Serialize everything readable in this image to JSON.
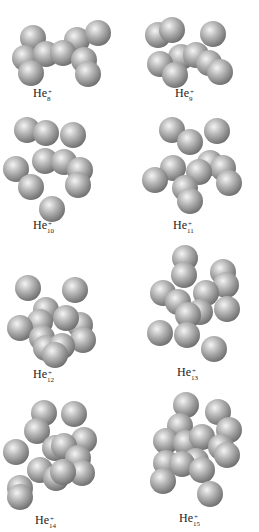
{
  "figure": {
    "title": "Structures of He_n^+ clusters",
    "sphere_color": {
      "highlight": "#f4f4f4",
      "mid": "#b4b4b4",
      "shadow": "#6c6c6c"
    },
    "panels": [
      {
        "id": "he8",
        "label_base": "He",
        "label_charge": "+",
        "label_n": "8",
        "label_x": 44,
        "label_y": 93,
        "spheres": [
          [
            33,
            38
          ],
          [
            77,
            40
          ],
          [
            98,
            33
          ],
          [
            25,
            58
          ],
          [
            46,
            54
          ],
          [
            63,
            53
          ],
          [
            84,
            60
          ],
          [
            31,
            73
          ],
          [
            88,
            74
          ]
        ]
      },
      {
        "id": "he9",
        "label_base": "He",
        "label_charge": "+",
        "label_n": "9",
        "label_x": 186,
        "label_y": 93,
        "spheres": [
          [
            158,
            35
          ],
          [
            172,
            30
          ],
          [
            213,
            34
          ],
          [
            181,
            57
          ],
          [
            196,
            55
          ],
          [
            209,
            63
          ],
          [
            160,
            64
          ],
          [
            175,
            75
          ],
          [
            220,
            72
          ]
        ]
      },
      {
        "id": "he10",
        "label_base": "He",
        "label_charge": "+",
        "label_n": "10",
        "label_x": 46,
        "label_y": 225,
        "spheres": [
          [
            27,
            130
          ],
          [
            46,
            133
          ],
          [
            73,
            135
          ],
          [
            45,
            161
          ],
          [
            64,
            162
          ],
          [
            16,
            169
          ],
          [
            31,
            187
          ],
          [
            80,
            170
          ],
          [
            78,
            185
          ],
          [
            52,
            209
          ]
        ]
      },
      {
        "id": "he11",
        "label_base": "He",
        "label_charge": "+",
        "label_n": "11",
        "label_x": 186,
        "label_y": 225,
        "spheres": [
          [
            172,
            130
          ],
          [
            217,
            131
          ],
          [
            190,
            142
          ],
          [
            173,
            168
          ],
          [
            210,
            163
          ],
          [
            223,
            168
          ],
          [
            155,
            180
          ],
          [
            199,
            172
          ],
          [
            229,
            183
          ],
          [
            185,
            188
          ],
          [
            190,
            201
          ]
        ]
      },
      {
        "id": "he12",
        "label_base": "He",
        "label_charge": "+",
        "label_n": "12",
        "label_x": 46,
        "label_y": 374,
        "spheres": [
          [
            28,
            288
          ],
          [
            75,
            290
          ],
          [
            46,
            310
          ],
          [
            40,
            322
          ],
          [
            80,
            325
          ],
          [
            66,
            318
          ],
          [
            20,
            328
          ],
          [
            42,
            338
          ],
          [
            83,
            340
          ],
          [
            46,
            348
          ],
          [
            62,
            346
          ],
          [
            55,
            355
          ]
        ]
      },
      {
        "id": "he13",
        "label_base": "He",
        "label_charge": "+",
        "label_n": "13",
        "label_x": 190,
        "label_y": 372,
        "spheres": [
          [
            185,
            258
          ],
          [
            184,
            275
          ],
          [
            223,
            272
          ],
          [
            226,
            285
          ],
          [
            163,
            293
          ],
          [
            178,
            302
          ],
          [
            206,
            293
          ],
          [
            200,
            312
          ],
          [
            227,
            309
          ],
          [
            188,
            315
          ],
          [
            160,
            333
          ],
          [
            187,
            335
          ],
          [
            214,
            349
          ]
        ]
      },
      {
        "id": "he14",
        "label_base": "He",
        "label_charge": "+",
        "label_n": "14",
        "label_x": 48,
        "label_y": 520,
        "spheres": [
          [
            44,
            413
          ],
          [
            74,
            414
          ],
          [
            37,
            431
          ],
          [
            84,
            440
          ],
          [
            16,
            452
          ],
          [
            55,
            448
          ],
          [
            64,
            446
          ],
          [
            78,
            458
          ],
          [
            40,
            470
          ],
          [
            82,
            473
          ],
          [
            20,
            488
          ],
          [
            56,
            478
          ],
          [
            63,
            472
          ],
          [
            20,
            497
          ]
        ]
      },
      {
        "id": "he15",
        "label_base": "He",
        "label_charge": "+",
        "label_n": "15",
        "label_x": 192,
        "label_y": 518,
        "spheres": [
          [
            186,
            405
          ],
          [
            218,
            412
          ],
          [
            180,
            426
          ],
          [
            229,
            430
          ],
          [
            166,
            441
          ],
          [
            186,
            443
          ],
          [
            202,
            437
          ],
          [
            221,
            447
          ],
          [
            227,
            455
          ],
          [
            196,
            461
          ],
          [
            166,
            463
          ],
          [
            182,
            464
          ],
          [
            202,
            470
          ],
          [
            163,
            481
          ],
          [
            210,
            494
          ]
        ]
      }
    ]
  }
}
